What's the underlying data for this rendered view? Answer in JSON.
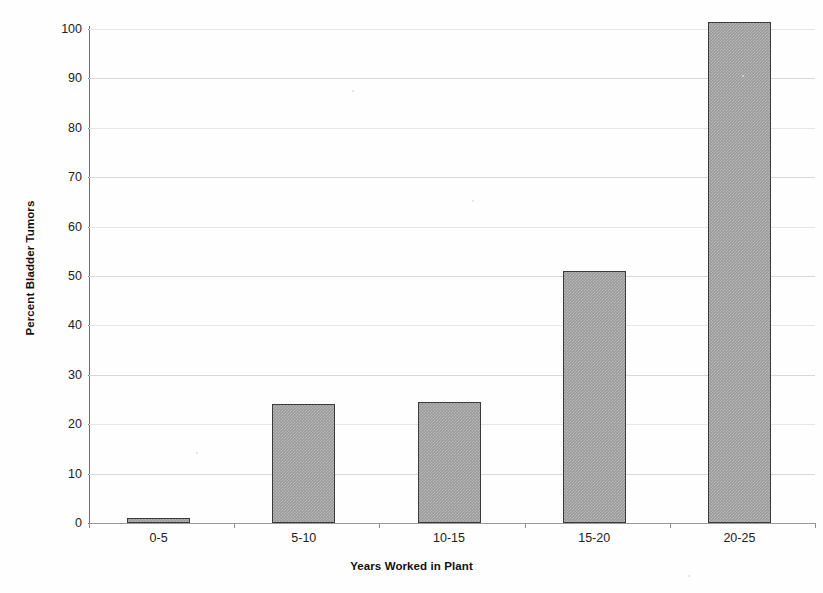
{
  "chart_data": {
    "type": "bar",
    "title": "",
    "xlabel": "Years Worked in Plant",
    "ylabel": "Percent Bladder Tumors",
    "categories": [
      "0-5",
      "5-10",
      "10-15",
      "15-20",
      "20-25"
    ],
    "values": [
      1,
      24,
      24.4,
      51,
      101.5
    ],
    "series": [
      {
        "name": "Percent Bladder Tumors",
        "values": [
          1,
          24,
          24.4,
          51,
          101.5
        ]
      }
    ],
    "ylim": [
      0,
      100
    ],
    "yticks": [
      0,
      10,
      20,
      30,
      40,
      50,
      60,
      70,
      80,
      90,
      100
    ],
    "ytick_labels": [
      "0",
      "10",
      "20",
      "30",
      "40",
      "50",
      "60",
      "70",
      "80",
      "90",
      "100"
    ],
    "grid": true,
    "grid_axis": "y",
    "legend": "none",
    "bar_fill_color": "#9a9a9a",
    "bar_border_color": "#3a3a3a",
    "gridline_color": "#d8d8d8",
    "axis_color": "#6d6d6d",
    "background_color": "#fefefe"
  }
}
